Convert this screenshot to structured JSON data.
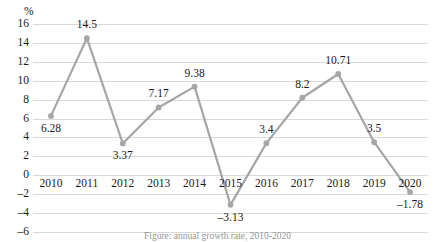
{
  "chart_data": {
    "type": "line",
    "title": "",
    "subtitle": "",
    "xlabel": "",
    "ylabel": "%",
    "categories": [
      "2010",
      "2011",
      "2012",
      "2013",
      "2014",
      "2015",
      "2016",
      "2017",
      "2018",
      "2019",
      "2020"
    ],
    "values": [
      6.28,
      14.5,
      3.37,
      7.17,
      9.38,
      -3.13,
      3.4,
      8.2,
      10.71,
      3.5,
      -1.78
    ],
    "data_labels": [
      "6.28",
      "14.5",
      "3.37",
      "7.17",
      "9.38",
      "-3.13",
      "3.4",
      "8.2",
      "10.71",
      "3.5",
      "-1.78"
    ],
    "label_positions": [
      "below",
      "above",
      "below",
      "above",
      "above",
      "below",
      "above",
      "above",
      "above",
      "above",
      "below"
    ],
    "ylim": [
      -6,
      16
    ],
    "ytick_values": [
      16,
      14,
      12,
      10,
      8,
      6,
      4,
      2,
      0,
      -2,
      -4,
      -6
    ],
    "ytick_labels": [
      "16",
      "14",
      "12",
      "10",
      "8",
      "6",
      "4",
      "2",
      "0",
      "-2",
      "-4",
      "-6"
    ],
    "grid": true,
    "legend": "none",
    "series": [
      {
        "name": "growth-rate",
        "values": [
          6.28,
          14.5,
          3.37,
          7.17,
          9.38,
          -3.13,
          3.4,
          8.2,
          10.71,
          3.5,
          -1.78
        ],
        "color": "#a6a6a6",
        "marker": "circle"
      }
    ]
  },
  "style": {
    "line_color": "#a6a6a6",
    "marker_color": "#a6a6a6",
    "grid_color": "#d9d9d9",
    "text_color": "#1a1a1a",
    "background": "#ffffff"
  },
  "caption": {
    "text": "Figure: annual growth rate, 2010-2020"
  }
}
